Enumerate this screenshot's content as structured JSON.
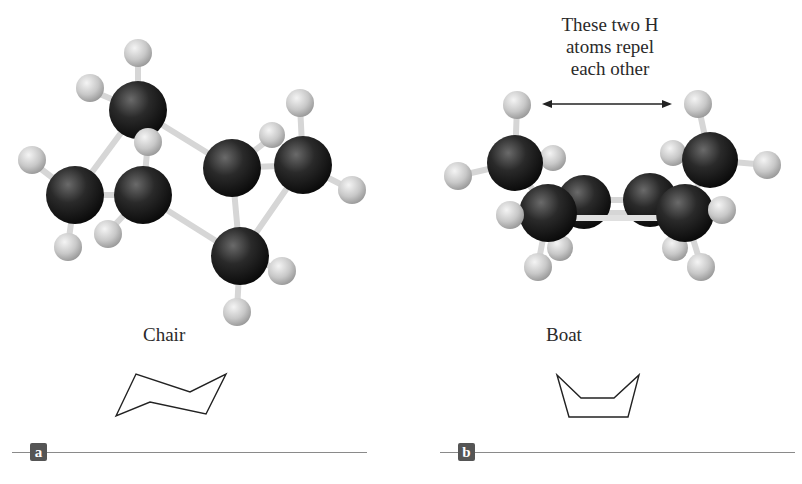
{
  "panels": [
    {
      "id": "a",
      "label": "a",
      "caption": "Chair"
    },
    {
      "id": "b",
      "label": "b",
      "caption": "Boat"
    }
  ],
  "annotation": {
    "lines": [
      "These two H",
      "atoms repel",
      "each other"
    ]
  },
  "colors": {
    "carbon": "#1e1e1e",
    "hydrogen": "#c8c8c8",
    "bond": "#d8d8d8",
    "panel_label_bg": "#555555",
    "rule": "#8a8a8a"
  }
}
